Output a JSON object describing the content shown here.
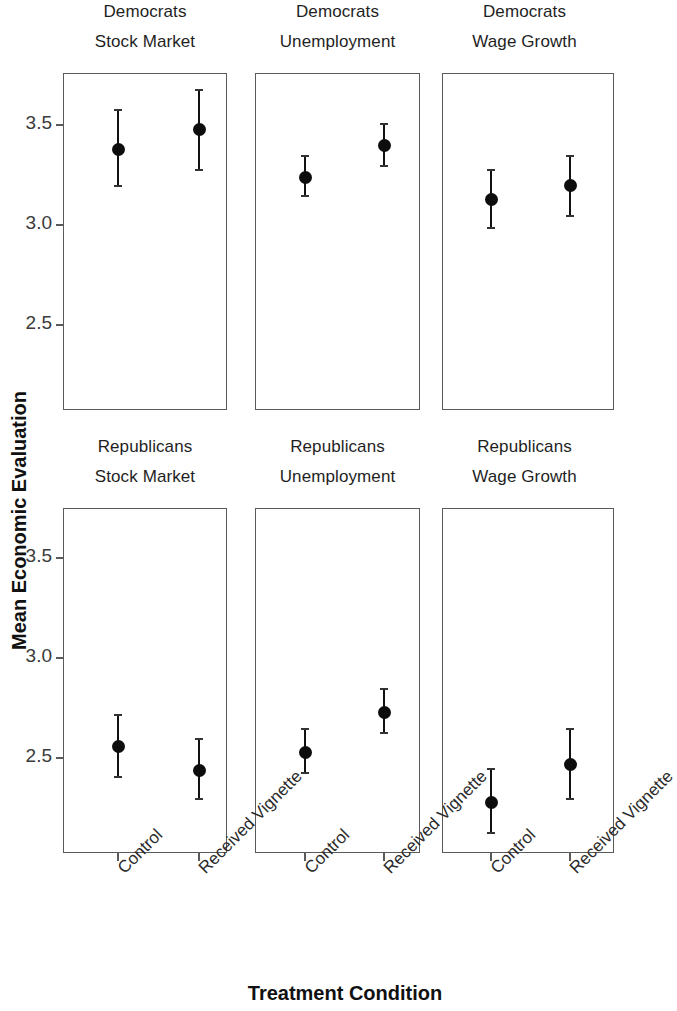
{
  "chart_data": {
    "type": "scatter",
    "title": "",
    "xlabel": "Treatment Condition",
    "ylabel": "Mean Economic Evaluation",
    "ylim": [
      2.12,
      3.78
    ],
    "yticks": [
      3.5,
      3.0,
      2.5
    ],
    "ytick_labels": [
      "3.5",
      "3.0",
      "2.5"
    ],
    "categories": [
      "Control",
      "Received Vignette"
    ],
    "grid": false,
    "legend": null,
    "facet_rows": [
      "Democrats",
      "Republicans"
    ],
    "facet_cols": [
      "Stock Market",
      "Unemployment",
      "Wage Growth"
    ],
    "panels": [
      {
        "party": "Democrats",
        "outcome": "Stock Market",
        "row": 0,
        "col": 0,
        "points": [
          {
            "x": "Control",
            "y": 3.38,
            "lo": 3.19,
            "hi": 3.58
          },
          {
            "x": "Received Vignette",
            "y": 3.48,
            "lo": 3.27,
            "hi": 3.68
          }
        ]
      },
      {
        "party": "Democrats",
        "outcome": "Unemployment",
        "row": 0,
        "col": 1,
        "points": [
          {
            "x": "Control",
            "y": 3.24,
            "lo": 3.14,
            "hi": 3.35
          },
          {
            "x": "Received Vignette",
            "y": 3.4,
            "lo": 3.29,
            "hi": 3.51
          }
        ]
      },
      {
        "party": "Democrats",
        "outcome": "Wage Growth",
        "row": 0,
        "col": 2,
        "points": [
          {
            "x": "Control",
            "y": 3.13,
            "lo": 2.98,
            "hi": 3.28
          },
          {
            "x": "Received Vignette",
            "y": 3.2,
            "lo": 3.04,
            "hi": 3.35
          }
        ]
      },
      {
        "party": "Republicans",
        "outcome": "Stock Market",
        "row": 1,
        "col": 0,
        "points": [
          {
            "x": "Control",
            "y": 2.56,
            "lo": 2.4,
            "hi": 2.72
          },
          {
            "x": "Received Vignette",
            "y": 2.44,
            "lo": 2.29,
            "hi": 2.6
          }
        ]
      },
      {
        "party": "Republicans",
        "outcome": "Unemployment",
        "row": 1,
        "col": 1,
        "points": [
          {
            "x": "Control",
            "y": 2.53,
            "lo": 2.42,
            "hi": 2.65
          },
          {
            "x": "Received Vignette",
            "y": 2.73,
            "lo": 2.62,
            "hi": 2.85
          }
        ]
      },
      {
        "party": "Republicans",
        "outcome": "Wage Growth",
        "row": 1,
        "col": 2,
        "points": [
          {
            "x": "Control",
            "y": 2.28,
            "lo": 2.12,
            "hi": 2.45
          },
          {
            "x": "Received Vignette",
            "y": 2.47,
            "lo": 2.29,
            "hi": 2.65
          }
        ]
      }
    ]
  },
  "strips": {
    "r0c0_top": "Democrats",
    "r0c0_bot": "Stock Market",
    "r0c1_top": "Democrats",
    "r0c1_bot": "Unemployment",
    "r0c2_top": "Democrats",
    "r0c2_bot": "Wage Growth",
    "r1c0_top": "Republicans",
    "r1c0_bot": "Stock Market",
    "r1c1_top": "Republicans",
    "r1c1_bot": "Unemployment",
    "r1c2_top": "Republicans",
    "r1c2_bot": "Wage Growth"
  },
  "axes": {
    "y_title": "Mean Economic Evaluation",
    "x_title": "Treatment Condition",
    "y_labels": [
      "3.5",
      "3.0",
      "2.5"
    ],
    "x_labels": [
      "Control",
      "Received Vignette"
    ]
  },
  "colors": {
    "mark": "#0d0d0d",
    "panel_border": "#5a5a5a",
    "text": "#1a1a1a",
    "background": "#ffffff"
  }
}
